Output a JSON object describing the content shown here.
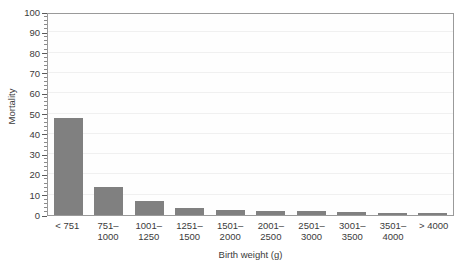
{
  "figure": {
    "cropped_title": "",
    "background_color": "#ffffff",
    "bar_color": "#808080",
    "axis_color": "#5a5a5a",
    "grid_color": "#f0f0f0"
  },
  "chart_data": {
    "type": "bar",
    "title": "",
    "xlabel": "Birth weight (g)",
    "ylabel": "Mortality",
    "categories": [
      "< 751",
      "751–1000",
      "1001–1250",
      "1251–1500",
      "1501–2000",
      "2001–2500",
      "2501–3000",
      "3001–3500",
      "3501–4000",
      "> 4000"
    ],
    "category_lines": [
      [
        "< 751",
        ""
      ],
      [
        "751–",
        "1000"
      ],
      [
        "1001–",
        "1250"
      ],
      [
        "1251–",
        "1500"
      ],
      [
        "1501–",
        "2000"
      ],
      [
        "2001–",
        "2500"
      ],
      [
        "2501–",
        "3000"
      ],
      [
        "3001–",
        "3500"
      ],
      [
        "3501–",
        "4000"
      ],
      [
        "> 4000",
        ""
      ]
    ],
    "values": [
      48,
      14,
      7,
      3.5,
      2.5,
      2,
      2,
      1.5,
      1,
      1
    ],
    "ylim": [
      0,
      100
    ],
    "ytick_values": [
      0,
      10,
      20,
      30,
      40,
      50,
      60,
      70,
      80,
      90,
      100
    ],
    "ytick_labels": [
      "0",
      "10",
      "20",
      "30",
      "40",
      "50",
      "60",
      "70",
      "80",
      "90",
      "100"
    ],
    "yminor_step": 2,
    "grid": "horizontal-faint",
    "legend": "none"
  }
}
